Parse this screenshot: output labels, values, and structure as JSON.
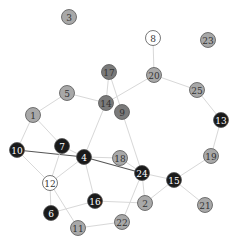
{
  "diagram": {
    "type": "network-graph",
    "colors": {
      "black": "#1a1a1a",
      "dark_gray": "#7a7a7a",
      "gray": "#a8a8a8",
      "white": "#ffffff",
      "edge": "#d8d8d8",
      "edge_strong": "#555555",
      "stroke": "#555555"
    },
    "nodes": [
      {
        "id": "1",
        "x": 33,
        "y": 115,
        "fill": "gray"
      },
      {
        "id": "2",
        "x": 145,
        "y": 203,
        "fill": "gray"
      },
      {
        "id": "3",
        "x": 69,
        "y": 17,
        "fill": "gray"
      },
      {
        "id": "4",
        "x": 84,
        "y": 157,
        "fill": "black"
      },
      {
        "id": "5",
        "x": 67,
        "y": 93,
        "fill": "gray"
      },
      {
        "id": "6",
        "x": 51,
        "y": 213,
        "fill": "black"
      },
      {
        "id": "7",
        "x": 62,
        "y": 146,
        "fill": "black"
      },
      {
        "id": "8",
        "x": 153,
        "y": 38,
        "fill": "white"
      },
      {
        "id": "9",
        "x": 122,
        "y": 112,
        "fill": "dark_gray"
      },
      {
        "id": "10",
        "x": 17,
        "y": 150,
        "fill": "black"
      },
      {
        "id": "11",
        "x": 78,
        "y": 228,
        "fill": "gray"
      },
      {
        "id": "12",
        "x": 50,
        "y": 183,
        "fill": "white"
      },
      {
        "id": "13",
        "x": 221,
        "y": 120,
        "fill": "black"
      },
      {
        "id": "14",
        "x": 106,
        "y": 103,
        "fill": "dark_gray"
      },
      {
        "id": "15",
        "x": 174,
        "y": 180,
        "fill": "black"
      },
      {
        "id": "16",
        "x": 95,
        "y": 201,
        "fill": "black"
      },
      {
        "id": "17",
        "x": 109,
        "y": 72,
        "fill": "dark_gray"
      },
      {
        "id": "18",
        "x": 120,
        "y": 158,
        "fill": "gray"
      },
      {
        "id": "19",
        "x": 211,
        "y": 156,
        "fill": "gray"
      },
      {
        "id": "20",
        "x": 154,
        "y": 75,
        "fill": "gray"
      },
      {
        "id": "21",
        "x": 205,
        "y": 205,
        "fill": "gray"
      },
      {
        "id": "22",
        "x": 122,
        "y": 222,
        "fill": "gray"
      },
      {
        "id": "23",
        "x": 208,
        "y": 40,
        "fill": "gray"
      },
      {
        "id": "24",
        "x": 142,
        "y": 173,
        "fill": "black"
      },
      {
        "id": "25",
        "x": 197,
        "y": 90,
        "fill": "gray"
      }
    ],
    "edges": [
      {
        "from": "8",
        "to": "20"
      },
      {
        "from": "20",
        "to": "25"
      },
      {
        "from": "25",
        "to": "13"
      },
      {
        "from": "13",
        "to": "19"
      },
      {
        "from": "19",
        "to": "15"
      },
      {
        "from": "15",
        "to": "21"
      },
      {
        "from": "15",
        "to": "24"
      },
      {
        "from": "15",
        "to": "2"
      },
      {
        "from": "24",
        "to": "2"
      },
      {
        "from": "24",
        "to": "22"
      },
      {
        "from": "24",
        "to": "9"
      },
      {
        "from": "24",
        "to": "18"
      },
      {
        "from": "20",
        "to": "14"
      },
      {
        "from": "17",
        "to": "14"
      },
      {
        "from": "17",
        "to": "9"
      },
      {
        "from": "5",
        "to": "14"
      },
      {
        "from": "5",
        "to": "1"
      },
      {
        "from": "1",
        "to": "10"
      },
      {
        "from": "1",
        "to": "7"
      },
      {
        "from": "14",
        "to": "4"
      },
      {
        "from": "10",
        "to": "4",
        "strong": true
      },
      {
        "from": "10",
        "to": "12"
      },
      {
        "from": "7",
        "to": "12"
      },
      {
        "from": "7",
        "to": "4"
      },
      {
        "from": "4",
        "to": "18"
      },
      {
        "from": "4",
        "to": "24",
        "strong": true
      },
      {
        "from": "4",
        "to": "12"
      },
      {
        "from": "4",
        "to": "16"
      },
      {
        "from": "12",
        "to": "6"
      },
      {
        "from": "12",
        "to": "11"
      },
      {
        "from": "16",
        "to": "2"
      },
      {
        "from": "11",
        "to": "22"
      },
      {
        "from": "6",
        "to": "16"
      }
    ]
  }
}
